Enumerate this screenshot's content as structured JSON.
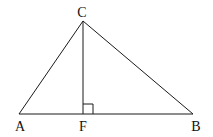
{
  "diagram": {
    "points": {
      "A": {
        "label": "A",
        "x": 19,
        "y": 114,
        "lx": 20,
        "ly": 131
      },
      "B": {
        "label": "B",
        "x": 193,
        "y": 114,
        "lx": 196,
        "ly": 131
      },
      "C": {
        "label": "C",
        "x": 83,
        "y": 21,
        "lx": 82,
        "ly": 17
      },
      "F": {
        "label": "F",
        "x": 83,
        "y": 114,
        "lx": 83,
        "ly": 131
      }
    },
    "segments": [
      "AB",
      "AC",
      "BC",
      "CF"
    ],
    "right_angle_at": "F",
    "stroke_color": "#1a1a1a"
  }
}
